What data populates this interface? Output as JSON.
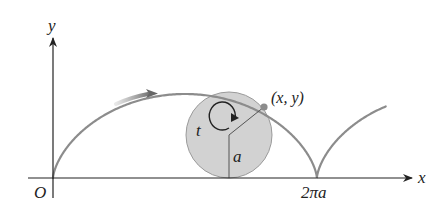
{
  "figure": {
    "labels": {
      "y_axis": "y",
      "x_axis": "x",
      "origin": "O",
      "point": "(x, y)",
      "angle": "t",
      "radius": "a",
      "period_tick": "2πa"
    },
    "colors": {
      "axes": "#222222",
      "curve": "#8c8c8c",
      "circle_fill": "#d2d2d2",
      "circle_stroke": "#9a9a9a",
      "point": "#8c8c8c",
      "annotation": "#222222"
    }
  },
  "geometry": {
    "origin_px": [
      53,
      178
    ],
    "a_px": 42,
    "circle_center_px": [
      229,
      135
    ],
    "point_px": [
      264,
      107
    ]
  }
}
